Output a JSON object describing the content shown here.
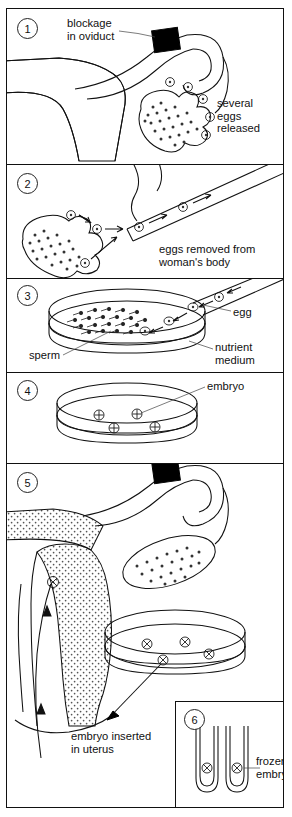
{
  "figure": {
    "type": "labelled-process-diagram",
    "panel_count": 6,
    "line_color": "#111111",
    "background_color": "#ffffff",
    "stipple_fill": "dotted"
  },
  "panels": [
    {
      "number": "1",
      "caption_labels": [
        {
          "id": "blockage",
          "text": "blockage\nin oviduct",
          "points_to": "black block on oviduct"
        },
        {
          "id": "eggs-released",
          "text": "several\neggs\nreleased",
          "points_to": "ovary"
        }
      ],
      "structures": [
        "uterus",
        "oviduct",
        "ovary",
        "blockage"
      ],
      "egg_count": 4
    },
    {
      "number": "2",
      "caption_labels": [
        {
          "id": "eggs-removed",
          "text": "eggs removed from\nwoman's body",
          "points_to": "needle"
        }
      ],
      "structures": [
        "ovary",
        "collection needle",
        "eggs in transit"
      ],
      "egg_count": 5
    },
    {
      "number": "3",
      "caption_labels": [
        {
          "id": "egg",
          "text": "egg",
          "points_to": "egg entering dish"
        },
        {
          "id": "sperm",
          "text": "sperm",
          "points_to": "sperm in dish"
        },
        {
          "id": "nutrient-medium",
          "text": "nutrient\nmedium",
          "points_to": "petri dish"
        }
      ],
      "structures": [
        "petri dish",
        "sperm",
        "eggs",
        "needle"
      ],
      "egg_count": 3
    },
    {
      "number": "4",
      "caption_labels": [
        {
          "id": "embryo",
          "text": "embryo",
          "points_to": "embryo in dish"
        }
      ],
      "structures": [
        "petri dish",
        "embryos"
      ],
      "embryo_count": 4
    },
    {
      "number": "5",
      "caption_labels": [
        {
          "id": "embryo-inserted",
          "text": "embryo inserted\nin uterus",
          "points_to": "uterus"
        }
      ],
      "structures": [
        "uterus",
        "oviduct",
        "ovary",
        "blockage",
        "petri dish",
        "embryos",
        "insertion catheter"
      ],
      "embryo_count": 4
    },
    {
      "number": "6",
      "caption_labels": [
        {
          "id": "frozen-embryo",
          "text": "frozen\nembryo",
          "points_to": "test tube"
        }
      ],
      "structures": [
        "test tubes",
        "frozen embryos"
      ],
      "tube_count": 2
    }
  ]
}
